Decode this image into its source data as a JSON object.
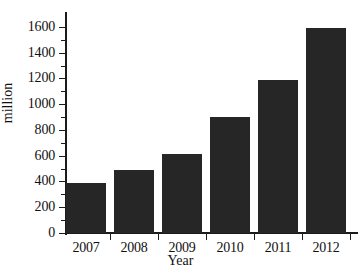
{
  "chart_data": {
    "type": "bar",
    "title": "",
    "subtitle": "",
    "categories": [
      "2007",
      "2008",
      "2009",
      "2010",
      "2011",
      "2012"
    ],
    "values": [
      390,
      490,
      615,
      900,
      1190,
      1595
    ],
    "xlabel": "Year",
    "ylabel": "million",
    "ylim": [
      0,
      1700
    ],
    "xlim_note": "categorical",
    "yticks": [
      0,
      200,
      400,
      600,
      800,
      1000,
      1200,
      1400,
      1600
    ],
    "ytick_labels": [
      "0",
      "200",
      "400",
      "600",
      "800",
      "1000",
      "1200",
      "1400",
      "1600"
    ],
    "xtick_labels": [
      "2007",
      "2008",
      "2009",
      "2010",
      "2011",
      "2012"
    ],
    "grid": false,
    "legend": false,
    "legend_position": "none",
    "bar_color": "#262626",
    "axis_color": "#1b1b1b",
    "background_color": "#ffffff",
    "series": [
      {
        "name": "million",
        "values": [
          390,
          490,
          615,
          900,
          1190,
          1595
        ]
      }
    ]
  }
}
